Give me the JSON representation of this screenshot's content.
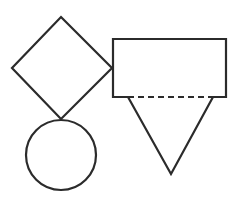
{
  "diagram": {
    "stroke_color": "#2b2b2b",
    "background": "#ffffff",
    "shapes": [
      {
        "name": "diamond",
        "type": "square-rotated-45",
        "points": [
          [
            61,
            17
          ],
          [
            112,
            68
          ],
          [
            61,
            119
          ],
          [
            12,
            68
          ]
        ]
      },
      {
        "name": "circle",
        "type": "circle",
        "center": [
          61,
          155
        ],
        "radius": 35
      },
      {
        "name": "rectangle",
        "type": "rectangle",
        "x": 113,
        "y": 39,
        "width": 113,
        "height": 58
      },
      {
        "name": "triangle",
        "type": "inverted-triangle",
        "points": [
          [
            128,
            97
          ],
          [
            213,
            97
          ],
          [
            171,
            174
          ]
        ]
      },
      {
        "name": "dashed-edge",
        "type": "dashed-line",
        "from": [
          128,
          97
        ],
        "to": [
          213,
          97
        ]
      }
    ]
  }
}
